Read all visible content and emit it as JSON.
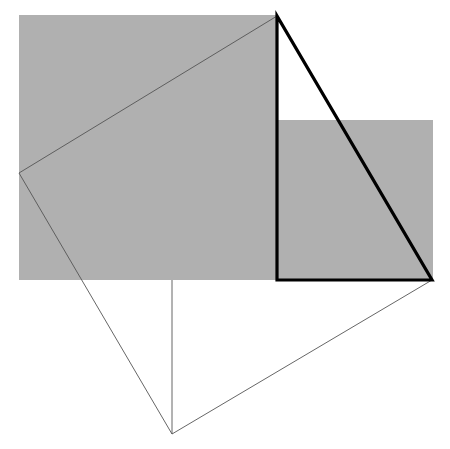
{
  "figure": {
    "canvas": {
      "width": 450,
      "height": 449,
      "background": "#ffffff"
    },
    "colors": {
      "shaded_fill": "#b0b0b0",
      "thick_stroke": "#000000",
      "thin_stroke": "#555555",
      "background": "#ffffff"
    },
    "stroke_widths": {
      "thick": 3.2,
      "thin": 0.9
    },
    "shapes": [
      {
        "name": "upper-left-shaded-rectangle",
        "kind": "rectangle",
        "fill": "#b0b0b0",
        "stroke": "none",
        "points": "19,15 277,15 277,280 19,280",
        "corners": {
          "x": 19,
          "y": 15,
          "width": 258,
          "height": 265
        }
      },
      {
        "name": "lower-right-shaded-rectangle",
        "kind": "rectangle",
        "fill": "#b0b0b0",
        "stroke": "none",
        "points": "277,120 433,120 433,280 277,280",
        "corners": {
          "x": 277,
          "y": 120,
          "width": 156,
          "height": 160
        }
      },
      {
        "name": "tilted-square-outline",
        "kind": "quadrilateral",
        "fill": "none",
        "stroke": "#555555",
        "stroke_width": 0.9,
        "points": "19,173 277,16 432,280 172,434",
        "vertices": [
          {
            "label": "left",
            "x": 19,
            "y": 173
          },
          {
            "label": "top",
            "x": 277,
            "y": 16
          },
          {
            "label": "right",
            "x": 432,
            "y": 280
          },
          {
            "label": "bottom",
            "x": 172,
            "y": 434
          }
        ]
      },
      {
        "name": "thick-right-triangle",
        "kind": "triangle",
        "fill": "none",
        "stroke": "#000000",
        "stroke_width": 3.2,
        "points": "277,16 277,280 432,280",
        "vertices": [
          {
            "label": "apex",
            "x": 277,
            "y": 16
          },
          {
            "label": "right-angle",
            "x": 277,
            "y": 280
          },
          {
            "label": "base-right",
            "x": 432,
            "y": 280
          }
        ],
        "right_angle_at": "right-angle"
      },
      {
        "name": "vertical-construction-line",
        "kind": "line",
        "stroke": "#555555",
        "stroke_width": 0.9,
        "x1": 172,
        "y1": 280,
        "x2": 172,
        "y2": 434
      }
    ]
  }
}
